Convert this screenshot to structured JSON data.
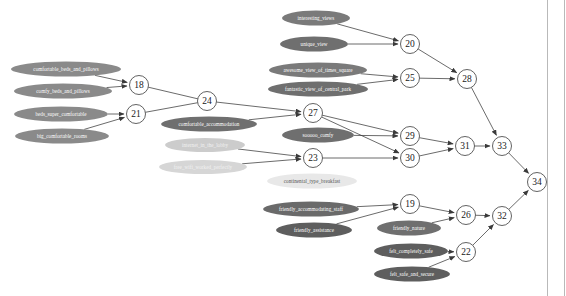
{
  "diagram": {
    "type": "directed-graph",
    "background_color": "#ffffff",
    "edge_color": "#3a3a3a",
    "node_fill": "#ffffff",
    "node_stroke": "#3a3a3a",
    "frame_color": "#b9b9b9",
    "terms": [
      {
        "id": "t1",
        "label": "comfortable_beds_and_pillows",
        "cx": 66,
        "cy": 69,
        "rx": 55,
        "ry": 7.5,
        "fill": "#8a8a8a",
        "text_color": "#ffffff"
      },
      {
        "id": "t2",
        "label": "comfy_beds_and_pillows",
        "cx": 63,
        "cy": 91,
        "rx": 49,
        "ry": 7.5,
        "fill": "#8a8a8a",
        "text_color": "#ffffff"
      },
      {
        "id": "t3",
        "label": "beds_super_comfortable",
        "cx": 61,
        "cy": 114,
        "rx": 47,
        "ry": 7.5,
        "fill": "#8a8a8a",
        "text_color": "#ffffff"
      },
      {
        "id": "t4",
        "label": "big_comfortable_rooms",
        "cx": 62,
        "cy": 136,
        "rx": 47,
        "ry": 7.5,
        "fill": "#8a8a8a",
        "text_color": "#ffffff"
      },
      {
        "id": "t5",
        "label": "comfortable_accommodation",
        "cx": 209,
        "cy": 124,
        "rx": 48,
        "ry": 7.5,
        "fill": "#6f6f6f",
        "text_color": "#ffffff"
      },
      {
        "id": "t6",
        "label": "internet_in_the_lobby",
        "cx": 205,
        "cy": 145,
        "rx": 40,
        "ry": 7.0,
        "fill": "#cccccc",
        "text_color": "#f2f2f2"
      },
      {
        "id": "t7",
        "label": "free_wifi_worked_perfectly",
        "cx": 203,
        "cy": 167,
        "rx": 44,
        "ry": 7.0,
        "fill": "#d6d6d6",
        "text_color": "#f2f2f2"
      },
      {
        "id": "t8",
        "label": "interesting_views",
        "cx": 316,
        "cy": 18,
        "rx": 34,
        "ry": 7.5,
        "fill": "#7a7a7a",
        "text_color": "#ffffff"
      },
      {
        "id": "t9",
        "label": "unique_view",
        "cx": 314,
        "cy": 44,
        "rx": 34,
        "ry": 7.5,
        "fill": "#6f6f6f",
        "text_color": "#ffffff"
      },
      {
        "id": "t10",
        "label": "awesome_view_of_times_square",
        "cx": 318,
        "cy": 70,
        "rx": 49,
        "ry": 7.5,
        "fill": "#7a7a7a",
        "text_color": "#ffffff"
      },
      {
        "id": "t11",
        "label": "fantastic_view_of_central_park",
        "cx": 318,
        "cy": 89,
        "rx": 50,
        "ry": 7.5,
        "fill": "#6f6f6f",
        "text_color": "#ffffff"
      },
      {
        "id": "t12",
        "label": "sooooo_comfy",
        "cx": 318,
        "cy": 135,
        "rx": 36,
        "ry": 7.5,
        "fill": "#6f6f6f",
        "text_color": "#ffffff"
      },
      {
        "id": "t13",
        "label": "continental_type_breakfast",
        "cx": 312,
        "cy": 181,
        "rx": 45,
        "ry": 7.5,
        "fill": "#e8e8e8",
        "text_color": "#555555"
      },
      {
        "id": "t14",
        "label": "friendly_accommodating_staff",
        "cx": 311,
        "cy": 209,
        "rx": 48,
        "ry": 7.5,
        "fill": "#6a6a6a",
        "text_color": "#ffffff"
      },
      {
        "id": "t15",
        "label": "friendly_assistance",
        "cx": 314,
        "cy": 230,
        "rx": 38,
        "ry": 7.5,
        "fill": "#5e5e5e",
        "text_color": "#ffffff"
      },
      {
        "id": "t16",
        "label": "friendly_nature",
        "cx": 409,
        "cy": 228,
        "rx": 32,
        "ry": 7.5,
        "fill": "#6f6f6f",
        "text_color": "#ffffff"
      },
      {
        "id": "t17",
        "label": "felt_completely_safe",
        "cx": 411,
        "cy": 251,
        "rx": 37,
        "ry": 7.5,
        "fill": "#5e5e5e",
        "text_color": "#ffffff"
      },
      {
        "id": "t18",
        "label": "felt_safe_and_secure",
        "cx": 412,
        "cy": 274,
        "rx": 38,
        "ry": 7.5,
        "fill": "#5e5e5e",
        "text_color": "#ffffff"
      }
    ],
    "nodes": [
      {
        "id": "n18",
        "label": "18",
        "cx": 139,
        "cy": 85,
        "r": 9.5
      },
      {
        "id": "n21",
        "label": "21",
        "cx": 136,
        "cy": 114,
        "r": 9.5
      },
      {
        "id": "n24",
        "label": "24",
        "cx": 207,
        "cy": 101,
        "r": 9.5
      },
      {
        "id": "n27",
        "label": "27",
        "cx": 313,
        "cy": 113,
        "r": 9.5
      },
      {
        "id": "n23",
        "label": "23",
        "cx": 313,
        "cy": 158,
        "r": 9.5
      },
      {
        "id": "n20",
        "label": "20",
        "cx": 410,
        "cy": 44,
        "r": 9.5
      },
      {
        "id": "n25",
        "label": "25",
        "cx": 410,
        "cy": 78,
        "r": 9.5
      },
      {
        "id": "n28",
        "label": "28",
        "cx": 467,
        "cy": 79,
        "r": 9.5
      },
      {
        "id": "n29",
        "label": "29",
        "cx": 410,
        "cy": 136,
        "r": 9.5
      },
      {
        "id": "n30",
        "label": "30",
        "cx": 410,
        "cy": 158,
        "r": 9.5
      },
      {
        "id": "n31",
        "label": "31",
        "cx": 465,
        "cy": 146,
        "r": 9.5
      },
      {
        "id": "n33",
        "label": "33",
        "cx": 502,
        "cy": 146,
        "r": 9.5
      },
      {
        "id": "n34",
        "label": "34",
        "cx": 537,
        "cy": 182,
        "r": 9.5
      },
      {
        "id": "n19",
        "label": "19",
        "cx": 410,
        "cy": 204,
        "r": 9.5
      },
      {
        "id": "n26",
        "label": "26",
        "cx": 466,
        "cy": 215,
        "r": 9.5
      },
      {
        "id": "n32",
        "label": "32",
        "cx": 502,
        "cy": 216,
        "r": 9.5
      },
      {
        "id": "n22",
        "label": "22",
        "cx": 466,
        "cy": 252,
        "r": 9.5
      }
    ],
    "edges": [
      {
        "from": "t1",
        "to": "n18"
      },
      {
        "from": "t2",
        "to": "n18"
      },
      {
        "from": "t3",
        "to": "n21"
      },
      {
        "from": "t4",
        "to": "n21"
      },
      {
        "from": "n18",
        "to": "n24",
        "arrow": false
      },
      {
        "from": "n21",
        "to": "n24",
        "arrow": false
      },
      {
        "from": "n24",
        "to": "n27",
        "arrow": true
      },
      {
        "from": "t5",
        "to": "n27"
      },
      {
        "from": "t6",
        "to": "n23"
      },
      {
        "from": "t7",
        "to": "n23"
      },
      {
        "from": "t8",
        "to": "n20"
      },
      {
        "from": "t9",
        "to": "n20"
      },
      {
        "from": "t10",
        "to": "n25"
      },
      {
        "from": "t11",
        "to": "n25"
      },
      {
        "from": "n20",
        "to": "n28"
      },
      {
        "from": "n25",
        "to": "n28"
      },
      {
        "from": "n27",
        "to": "n29"
      },
      {
        "from": "t12",
        "to": "n29"
      },
      {
        "from": "n23",
        "to": "n30"
      },
      {
        "from": "n27",
        "to": "n30"
      },
      {
        "from": "n29",
        "to": "n31"
      },
      {
        "from": "n30",
        "to": "n31"
      },
      {
        "from": "n31",
        "to": "n33"
      },
      {
        "from": "n28",
        "to": "n33"
      },
      {
        "from": "n33",
        "to": "n34"
      },
      {
        "from": "t14",
        "to": "n19"
      },
      {
        "from": "t15",
        "to": "n19"
      },
      {
        "from": "n19",
        "to": "n26"
      },
      {
        "from": "t16",
        "to": "n26"
      },
      {
        "from": "t17",
        "to": "n22"
      },
      {
        "from": "t18",
        "to": "n22"
      },
      {
        "from": "n26",
        "to": "n32"
      },
      {
        "from": "n22",
        "to": "n32"
      },
      {
        "from": "n32",
        "to": "n34"
      }
    ]
  }
}
